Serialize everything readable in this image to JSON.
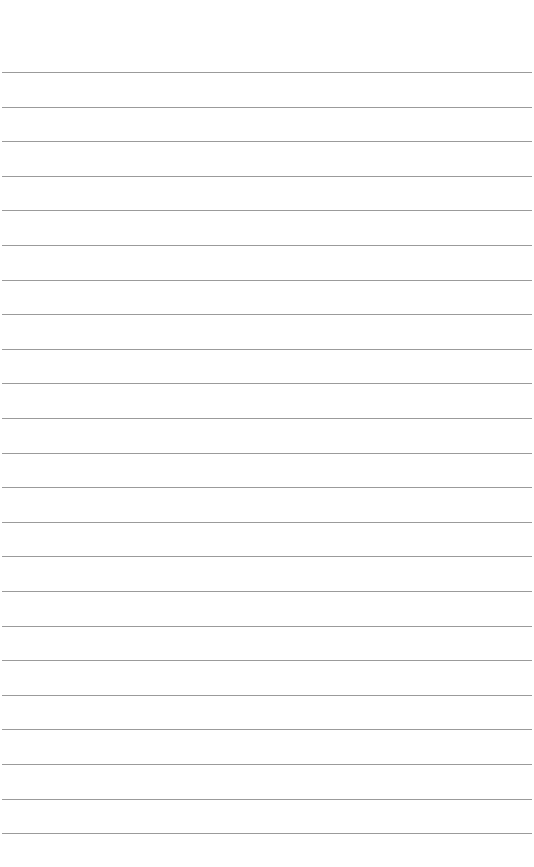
{
  "page": {
    "type": "lined-paper",
    "background_color": "#ffffff",
    "rule_color": "#8a8a8a",
    "rule_count": 23,
    "first_rule_y": 72,
    "rule_spacing": 34.6,
    "text_lines": []
  }
}
